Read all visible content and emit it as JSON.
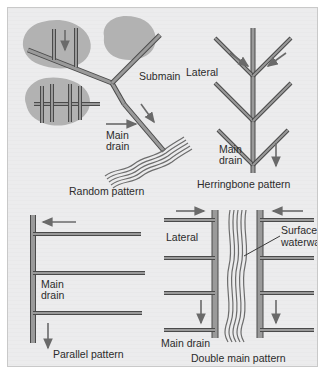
{
  "figure": {
    "background_color": "#ececed",
    "field_blob_color": "#b2b2b2",
    "pipe_fill_color": "#9a9a9a",
    "pipe_outline_color": "#4a4a4a",
    "arrow_color": "#6a6a6a",
    "text_color": "#2b2b2b"
  },
  "panels": [
    {
      "id": "random",
      "caption": "Random pattern",
      "labels": {
        "submain": "Submain",
        "main_drain_line1": "Main",
        "main_drain_line2": "drain"
      },
      "flow_arrows": [
        {
          "name": "lateral-flow-down",
          "direction": "down"
        },
        {
          "name": "main-drain-flow-right",
          "direction": "right"
        },
        {
          "name": "submain-flow-down-right",
          "direction": "down-right"
        }
      ],
      "features": [
        "isolated wet-spot fields",
        "branching main drain",
        "submain to upper field",
        "natural outlet stream"
      ]
    },
    {
      "id": "herringbone",
      "caption": "Herringbone pattern",
      "labels": {
        "lateral": "Lateral",
        "main_drain_line1": "Main",
        "main_drain_line2": "drain"
      },
      "flow_arrows": [
        {
          "name": "lateral-flow-left-row",
          "direction": "down-right"
        },
        {
          "name": "lateral-flow-right-row",
          "direction": "down-left"
        },
        {
          "name": "main-drain-flow-down",
          "direction": "down"
        }
      ],
      "lateral_rows": 3
    },
    {
      "id": "parallel",
      "caption": "Parallel pattern",
      "labels": {
        "main_drain_line1": "Main",
        "main_drain_line2": "drain"
      },
      "flow_arrows": [
        {
          "name": "lateral-flow-left",
          "direction": "left"
        },
        {
          "name": "main-drain-flow-down",
          "direction": "down"
        }
      ],
      "lateral_count": 3
    },
    {
      "id": "double-main",
      "caption": "Double main pattern",
      "labels": {
        "lateral": "Lateral",
        "surface_waterway_line1": "Surface",
        "surface_waterway_line2": "waterway",
        "main_drain": "Main drain"
      },
      "flow_arrows": [
        {
          "name": "left-lateral-flow-right",
          "direction": "right"
        },
        {
          "name": "right-lateral-flow-left",
          "direction": "left"
        },
        {
          "name": "left-main-flow-down",
          "direction": "down"
        },
        {
          "name": "right-main-flow-down",
          "direction": "down"
        }
      ],
      "mains": 2,
      "lateral_rows": 4
    }
  ]
}
